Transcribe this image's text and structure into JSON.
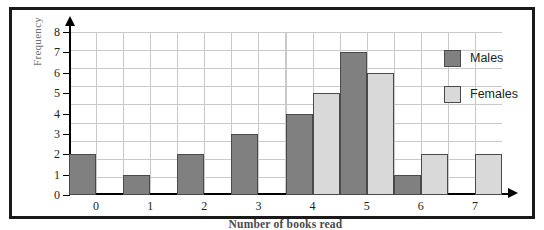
{
  "chart_data": {
    "type": "bar",
    "title": "",
    "xlabel": "Number of books read",
    "ylabel": "Frequency",
    "categories": [
      "0",
      "1",
      "2",
      "3",
      "4",
      "5",
      "6",
      "7"
    ],
    "series": [
      {
        "name": "Males",
        "color": "#808080",
        "values": [
          2,
          1,
          2,
          3,
          4,
          7,
          1,
          0
        ]
      },
      {
        "name": "Females",
        "color": "#d9d9d9",
        "values": [
          0,
          0,
          0,
          0,
          5,
          6,
          2,
          2
        ]
      }
    ],
    "ylim": [
      0,
      8
    ],
    "y_ticks": [
      "0",
      "1",
      "2",
      "3",
      "4",
      "5",
      "6",
      "7",
      "8"
    ],
    "grid": true,
    "legend_position": "top-right"
  },
  "legend": {
    "items": [
      {
        "label": "Males",
        "swatch": "males"
      },
      {
        "label": "Females",
        "swatch": "females"
      }
    ]
  }
}
